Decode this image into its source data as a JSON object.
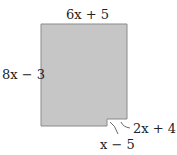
{
  "figure": {
    "shape": "rectangle with notch cut at bottom-right corner",
    "fill_color": "#c6c6c6",
    "stroke_color": "#8a8a8a",
    "labels": {
      "top": "6x + 5",
      "left": "8x − 3",
      "notch_right": "2x + 4",
      "notch_bottom": "x − 5"
    }
  }
}
